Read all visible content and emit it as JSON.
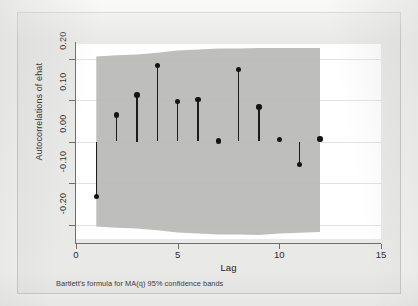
{
  "chart_data": {
    "type": "scatter",
    "title": "",
    "subtitle": "",
    "xlabel": "Lag",
    "ylabel": "Autocorrelations of ehat",
    "note": "Bartlett's formula for MA(q) 95% confidence bands",
    "grid": true,
    "legend_position": "none",
    "xlim": [
      0,
      15
    ],
    "ylim": [
      -0.235,
      0.235
    ],
    "x_ticks": [
      0,
      5,
      10,
      15
    ],
    "x_tick_labels": [
      "0",
      "5",
      "10",
      "15"
    ],
    "y_ticks": [
      0.2,
      0.1,
      0.0,
      -0.1,
      -0.2
    ],
    "y_tick_labels": [
      "0.20",
      "0.10",
      "0.00",
      "-0.10",
      "-0.20"
    ],
    "x": [
      1,
      2,
      3,
      4,
      5,
      6,
      7,
      8,
      9,
      10,
      11,
      12
    ],
    "series": [
      {
        "name": "Autocorrelations of ehat",
        "values": [
          -0.132,
          0.064,
          0.112,
          0.184,
          0.097,
          0.102,
          0.001,
          0.173,
          0.083,
          0.005,
          -0.056,
          0.006
        ]
      },
      {
        "name": "Bartlett 95% upper confidence band",
        "values": [
          0.205,
          0.208,
          0.21,
          0.214,
          0.219,
          0.222,
          0.224,
          0.224,
          0.225,
          0.225,
          0.225,
          0.225
        ]
      },
      {
        "name": "Bartlett 95% lower confidence band",
        "values": [
          -0.205,
          -0.208,
          -0.21,
          -0.214,
          -0.219,
          -0.222,
          -0.224,
          -0.224,
          -0.225,
          -0.222,
          -0.22,
          -0.218
        ]
      }
    ],
    "colors": {
      "marker": "#141414",
      "stem": "#1b1b1b",
      "confidence_band": "#b9b9b7",
      "panel_background": "#ffffff",
      "graph_background": "#e9e9e7",
      "gridline": "#e2e2e4",
      "axis": "#6d6d6d"
    }
  }
}
